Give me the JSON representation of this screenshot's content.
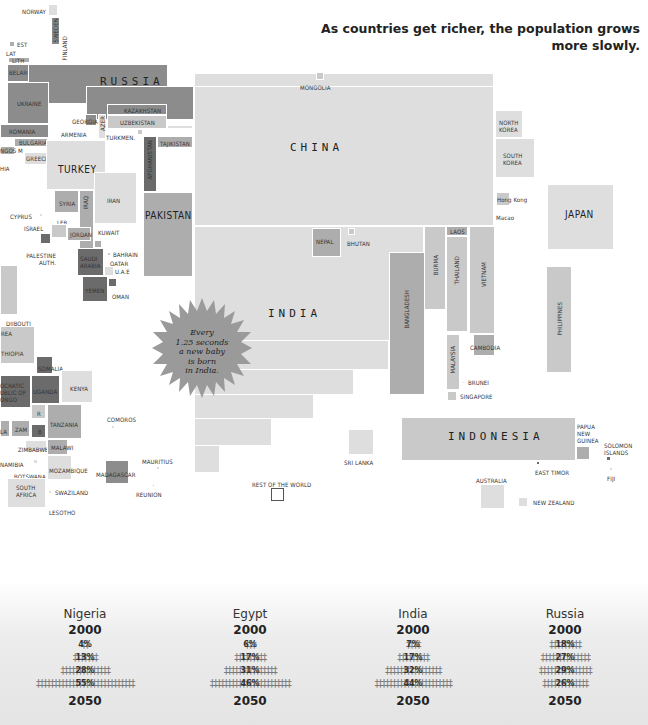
{
  "header": {
    "subtitle_line1": "As countries get richer, the population grows",
    "subtitle_line2": "more slowly."
  },
  "map": {
    "countries": {
      "norway": "NORWAY",
      "sweden": "SWEDEN",
      "finland": "FINLAND",
      "est": "EST",
      "lat": "LAT",
      "lith": "LITH",
      "belarus": "BELARUS",
      "russia": "RUSSIA",
      "ukraine": "UKRAINE",
      "romania": "ROMANIA",
      "bulgaria": "BULGARIA",
      "greece": "GREECE",
      "m": "M",
      "ngos": "NGOS",
      "hia": "HIA",
      "georgia": "GEORGIA",
      "armenia": "ARMENIA",
      "azer": "AZER",
      "kazakhstan": "KAZAKHSTAN",
      "uzbekistan": "UZBEKISTAN",
      "turkmen": "TURKMEN.",
      "kyrgyzstan": "KYRGYZSTAN",
      "tajikistan": "TAJIKISTAN",
      "afghanistan": "AFGHANISTAN",
      "turkey": "TURKEY",
      "syria": "SYRIA",
      "iraq": "IRAQ",
      "iran": "IRAN",
      "pakistan": "PAKISTAN",
      "cyprus": "CYPRUS",
      "leb": "LEB",
      "israel": "ISRAEL",
      "jordan": "JORDAN",
      "kuwait": "KUWAIT",
      "palestine": "PALESTINE AUTH.",
      "saudi": "SAUDI ARABIA",
      "bahrain": "BAHRAIN",
      "qatar": "QATAR",
      "uae": "U.A.E",
      "yemen": "YEMEN",
      "oman": "OMAN",
      "mongolia": "MONGOLIA",
      "china": "CHINA",
      "north_korea": "NORTH KOREA",
      "south_korea": "SOUTH KOREA",
      "hong_kong": "Hong Kong",
      "macao": "Macao",
      "japan": "JAPAN",
      "nepal": "NEPAL",
      "bhutan": "BHUTAN",
      "laos": "LAOS",
      "india": "INDIA",
      "bangladesh": "BANGLADESH",
      "burma": "BURMA",
      "thailand": "THAILAND",
      "vietnam": "VIETNAM",
      "philippines": "PHILIPPINES",
      "cambodia": "CAMBODIA",
      "malaysia": "MALAYSIA",
      "brunei": "BRUNEI",
      "singapore": "SINGAPORE",
      "indonesia": "INDONESIA",
      "sri_lanka": "SRI LANKA",
      "png": "PAPUA NEW GUINEA",
      "solomon": "SOLOMON ISLANDS",
      "east_timor": "EAST TIMOR",
      "fiji": "FIJI",
      "australia": "AUSTRALIA",
      "new_zealand": "NEW ZEALAND",
      "rest": "REST OF THE WORLD",
      "djibouti": "DJIBOUTI",
      "eritrea": "REA",
      "ethiopia": "THIOPIA",
      "somalia": "SOMALIA",
      "drc": "OCRATIC UBLIC OF ONGO",
      "uganda": "UGANDA",
      "kenya": "KENYA",
      "rwanda": "R",
      "burundi": "B",
      "tanzania": "TANZANIA",
      "zam": "ZAM",
      "la": "LA",
      "comoros": "COMOROS",
      "zimbabwe": "ZIMBABWE",
      "malawi": "MALAWI",
      "namibia": "NAMIBIA",
      "botswana": "BOTSWANA",
      "mozambique": "MOZAMBIQUE",
      "madagascar": "MADAGASCAR",
      "mauritius": "MAURITIUS",
      "south_africa": "SOUTH AFRICA",
      "swaziland": "SWAZILAND",
      "reunion": "REUNION",
      "lesotho": "LESOTHO"
    },
    "callout": {
      "line1": "Every",
      "line2": "1.25 seconds",
      "line3": "a new baby",
      "line4": "is born",
      "line5": "in India."
    }
  },
  "pyramids": [
    {
      "country": "Nigeria",
      "year_top": "2000",
      "year_bottom": "2050",
      "rows": [
        {
          "pct": "4%",
          "people": 2
        },
        {
          "pct": "13%",
          "people": 7
        },
        {
          "pct": "28%",
          "people": 14
        },
        {
          "pct": "55%",
          "people": 28
        }
      ]
    },
    {
      "country": "Egypt",
      "year_top": "2000",
      "year_bottom": "2050",
      "rows": [
        {
          "pct": "6%",
          "people": 3
        },
        {
          "pct": "17%",
          "people": 9
        },
        {
          "pct": "31%",
          "people": 15
        },
        {
          "pct": "46%",
          "people": 23
        }
      ]
    },
    {
      "country": "India",
      "year_top": "2000",
      "year_bottom": "2050",
      "rows": [
        {
          "pct": "7%",
          "people": 4
        },
        {
          "pct": "17%",
          "people": 9
        },
        {
          "pct": "32%",
          "people": 16
        },
        {
          "pct": "44%",
          "people": 22
        }
      ]
    },
    {
      "country": "Russia",
      "year_top": "2000",
      "year_bottom": "2050",
      "rows": [
        {
          "pct": "18%",
          "people": 9
        },
        {
          "pct": "27%",
          "people": 14
        },
        {
          "pct": "29%",
          "people": 15
        },
        {
          "pct": "26%",
          "people": 13
        }
      ]
    }
  ],
  "colors": {
    "shade1": "#dedede",
    "shade2": "#c9c9c9",
    "shade3": "#adadad",
    "shade4": "#8c8c8c",
    "shade5": "#6b6b6b",
    "burst": "#9a9a9a"
  }
}
